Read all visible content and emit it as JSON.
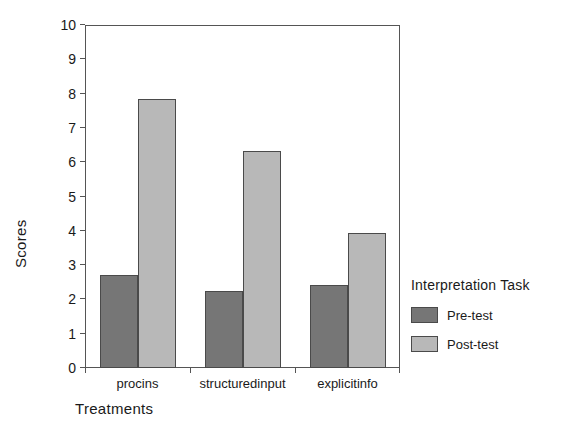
{
  "chart_data": {
    "type": "bar",
    "title": "",
    "xlabel": "Treatments",
    "ylabel": "Scores",
    "categories": [
      "procins",
      "structuredinput",
      "explicitinfo"
    ],
    "series": [
      {
        "name": "Pre-test",
        "color": "#767676",
        "values": [
          2.71,
          2.25,
          2.43
        ]
      },
      {
        "name": "Post-test",
        "color": "#b8b8b8",
        "values": [
          7.85,
          6.32,
          3.95
        ]
      }
    ],
    "ylim": [
      0,
      10
    ],
    "ytick_step": 1,
    "ytick_labels": [
      "0",
      "1",
      "2",
      "3",
      "4",
      "5",
      "6",
      "7",
      "8",
      "9",
      "10"
    ],
    "grid": false,
    "legend": {
      "title": "Interpretation Task",
      "position": "right",
      "entries": [
        {
          "label": "Pre-test",
          "color": "#767676"
        },
        {
          "label": "Post-test",
          "color": "#b8b8b8"
        }
      ]
    }
  }
}
